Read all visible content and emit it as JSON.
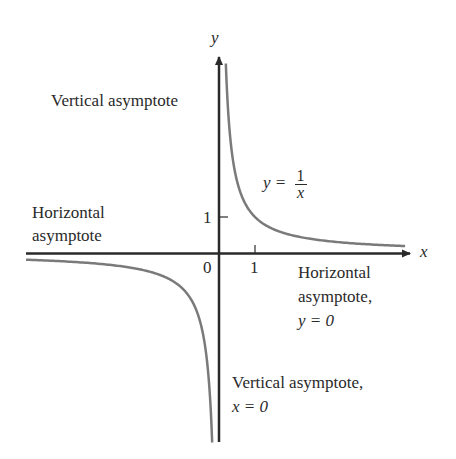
{
  "figure": {
    "type": "function-graph",
    "function": "y = 1/x",
    "colors": {
      "axis": "#2a2a2a",
      "curve": "#7a7a7a",
      "text": "#2a2a2a",
      "background": "#ffffff"
    }
  },
  "axes": {
    "x_label": "x",
    "y_label": "y",
    "origin_label": "0",
    "x_tick_label": "1",
    "y_tick_label": "1"
  },
  "equation": {
    "lhs": "y =",
    "numerator": "1",
    "denominator": "x"
  },
  "annotations": {
    "vertical_asymptote_top": "Vertical asymptote",
    "horizontal_asymptote_left_line1": "Horizontal",
    "horizontal_asymptote_left_line2": "asymptote",
    "horizontal_asymptote_right_line1": "Horizontal",
    "horizontal_asymptote_right_line2": "asymptote,",
    "horizontal_asymptote_right_line3": "y = 0",
    "vertical_asymptote_bottom_line1": "Vertical asymptote,",
    "vertical_asymptote_bottom_line2": "x = 0"
  }
}
